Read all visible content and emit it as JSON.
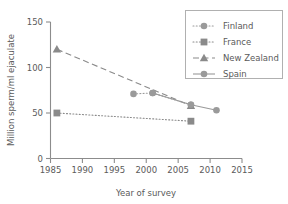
{
  "chart_data": {
    "type": "line",
    "title": "",
    "xlabel": "Year of survey",
    "ylabel": "Million sperm/ml ejaculate",
    "xlim": [
      1985,
      2015
    ],
    "ylim": [
      0,
      150
    ],
    "xticks": [
      1985,
      1990,
      1995,
      2000,
      2005,
      2010,
      2015
    ],
    "xtick_labels": [
      "1985",
      "1990",
      "1995",
      "2000",
      "2005",
      "2010",
      "2015"
    ],
    "yticks": [
      0,
      50,
      100,
      150
    ],
    "ytick_labels": [
      "0",
      "50",
      "100",
      "150"
    ],
    "grid": false,
    "legend_position": "top-right",
    "series": [
      {
        "name": "Finland",
        "marker": "circle",
        "linestyle": "dash-dot",
        "color": "#9a9a9a",
        "x": [
          1998,
          2001,
          2007
        ],
        "y": [
          71,
          72,
          59
        ]
      },
      {
        "name": "France",
        "marker": "square",
        "linestyle": "dotted",
        "color": "#8a8a8a",
        "x": [
          1986,
          2007
        ],
        "y": [
          50,
          41
        ]
      },
      {
        "name": "New Zealand",
        "marker": "triangle",
        "linestyle": "dashed",
        "color": "#8a8a8a",
        "x": [
          1986,
          2007
        ],
        "y": [
          120,
          58
        ]
      },
      {
        "name": "Spain",
        "marker": "circle",
        "linestyle": "solid",
        "color": "#9a9a9a",
        "x": [
          2001,
          2007,
          2011
        ],
        "y": [
          72,
          59,
          53
        ]
      }
    ]
  },
  "legend": {
    "items": [
      {
        "label": "Finland"
      },
      {
        "label": "France"
      },
      {
        "label": "New Zealand"
      },
      {
        "label": "Spain"
      }
    ]
  },
  "colors": {
    "axis": "#8c8c8c",
    "text": "#5a5a5a",
    "legend_border": "#b0b0b0",
    "background": "#ffffff"
  }
}
